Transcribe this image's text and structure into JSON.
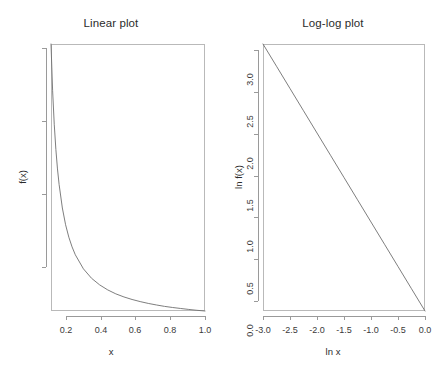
{
  "figure": {
    "background": "#ffffff",
    "line_color": "#6f6f6f",
    "axis_color": "#9a9a9a",
    "text_color": "#2b2b2b"
  },
  "chart_data": [
    {
      "type": "line",
      "title": "Linear plot",
      "xlabel": "x",
      "ylabel": "f(x)",
      "xlim": [
        0.05,
        1.0
      ],
      "ylim": [
        1.0,
        20.0
      ],
      "xticks": [
        0.2,
        0.4,
        0.6,
        0.8,
        1.0
      ],
      "xticklabels": [
        "0.2",
        "0.4",
        "0.6",
        "0.8",
        "1.0"
      ],
      "yticks": [
        5,
        10,
        15,
        20
      ],
      "yticklabels": [
        "5",
        "10",
        "15",
        "20"
      ],
      "grid": false,
      "legend": null,
      "series": [
        {
          "name": "f(x) = 1/x",
          "x": [
            0.05,
            0.06,
            0.07,
            0.08,
            0.09,
            0.1,
            0.12,
            0.14,
            0.16,
            0.18,
            0.2,
            0.25,
            0.3,
            0.35,
            0.4,
            0.45,
            0.5,
            0.55,
            0.6,
            0.65,
            0.7,
            0.75,
            0.8,
            0.85,
            0.9,
            0.95,
            1.0
          ],
          "y": [
            20.0,
            16.67,
            14.29,
            12.5,
            11.11,
            10.0,
            8.33,
            7.14,
            6.25,
            5.56,
            5.0,
            4.0,
            3.33,
            2.86,
            2.5,
            2.22,
            2.0,
            1.82,
            1.67,
            1.54,
            1.43,
            1.33,
            1.25,
            1.18,
            1.11,
            1.05,
            1.0
          ]
        }
      ]
    },
    {
      "type": "line",
      "title": "Log-log plot",
      "xlabel": "ln x",
      "ylabel": "ln f(x)",
      "xlim": [
        -3.0,
        0.0
      ],
      "ylim": [
        0.0,
        3.0
      ],
      "xticks": [
        -3.0,
        -2.5,
        -2.0,
        -1.5,
        -1.0,
        -0.5,
        0.0
      ],
      "xticklabels": [
        "-3.0",
        "-2.5",
        "-2.0",
        "-1.5",
        "-1.0",
        "-0.5",
        "0.0"
      ],
      "yticks": [
        0.0,
        0.5,
        1.0,
        1.5,
        2.0,
        2.5,
        3.0
      ],
      "yticklabels": [
        "0.0",
        "0.5",
        "1.0",
        "1.5",
        "2.0",
        "2.5",
        "3.0"
      ],
      "grid": false,
      "legend": null,
      "series": [
        {
          "name": "ln f(x) = -ln x",
          "x": [
            -3.0,
            -2.75,
            -2.5,
            -2.25,
            -2.0,
            -1.75,
            -1.5,
            -1.25,
            -1.0,
            -0.75,
            -0.5,
            -0.25,
            0.0
          ],
          "y": [
            3.0,
            2.75,
            2.5,
            2.25,
            2.0,
            1.75,
            1.5,
            1.25,
            1.0,
            0.75,
            0.5,
            0.25,
            0.0
          ]
        }
      ]
    }
  ]
}
